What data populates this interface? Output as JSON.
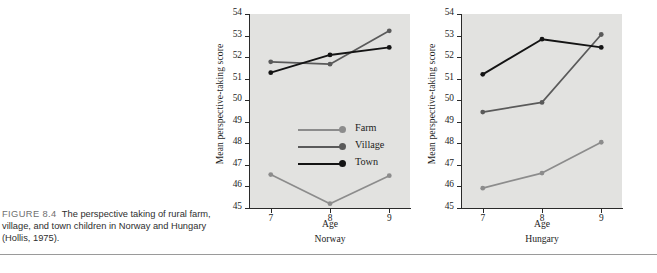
{
  "figure": {
    "label": "FIGURE 8.4",
    "caption": "The perspective taking of rural farm, village, and town children in Norway and Hungary (Hollis, 1975)."
  },
  "colors": {
    "farm": "#8c8c8c",
    "village": "#5a5a5a",
    "town": "#141414",
    "plot_background": "#e2e2e0",
    "axis": "#2a2a2a",
    "page_background": "#ffffff",
    "rule": "#9a9a9a"
  },
  "legend": {
    "position": "inside-left-middle",
    "entries": [
      {
        "label": "Farm",
        "color_key": "farm"
      },
      {
        "label": "Village",
        "color_key": "village"
      },
      {
        "label": "Town",
        "color_key": "town"
      }
    ]
  },
  "chart_data": [
    {
      "type": "line",
      "title": "Norway",
      "panel_caption": "Norway",
      "xlabel": "Age",
      "ylabel": "Mean perspective-taking  score",
      "categories": [
        7,
        8,
        9
      ],
      "xticklabels": [
        "7",
        "8",
        "9"
      ],
      "yticks": [
        45,
        46,
        47,
        48,
        49,
        50,
        51,
        52,
        53,
        54
      ],
      "yticklabels": [
        "45",
        "46",
        "47",
        "48",
        "49",
        "50",
        "51",
        "52",
        "53",
        "54"
      ],
      "xlim": [
        6.65,
        9.35
      ],
      "ylim": [
        45,
        54
      ],
      "grid": false,
      "series": [
        {
          "name": "Farm",
          "color_key": "farm",
          "values": [
            46.55,
            45.2,
            46.5
          ]
        },
        {
          "name": "Village",
          "color_key": "village",
          "values": [
            51.78,
            51.67,
            53.22
          ]
        },
        {
          "name": "Town",
          "color_key": "town",
          "values": [
            51.28,
            52.1,
            52.45
          ]
        }
      ]
    },
    {
      "type": "line",
      "title": "Hungary",
      "panel_caption": "Hungary",
      "xlabel": "Age",
      "ylabel": "Mean perspective-taking  score",
      "categories": [
        7,
        8,
        9
      ],
      "xticklabels": [
        "7",
        "8",
        "9"
      ],
      "yticks": [
        45,
        46,
        47,
        48,
        49,
        50,
        51,
        52,
        53,
        54
      ],
      "yticklabels": [
        "45",
        "46",
        "47",
        "48",
        "49",
        "50",
        "51",
        "52",
        "53",
        "54"
      ],
      "xlim": [
        6.65,
        9.35
      ],
      "ylim": [
        45,
        54
      ],
      "grid": false,
      "series": [
        {
          "name": "Farm",
          "color_key": "farm",
          "values": [
            45.92,
            46.62,
            48.05
          ]
        },
        {
          "name": "Village",
          "color_key": "village",
          "values": [
            49.45,
            49.9,
            53.05
          ]
        },
        {
          "name": "Town",
          "color_key": "town",
          "values": [
            51.2,
            52.83,
            52.45
          ]
        }
      ]
    }
  ]
}
